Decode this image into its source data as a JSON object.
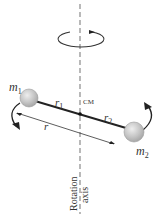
{
  "diagram": {
    "labels": {
      "mass1": "m",
      "mass1_sub": "1",
      "mass2": "m",
      "mass2_sub": "2",
      "radius1": "r",
      "radius1_sub": "1",
      "radius2": "r",
      "radius2_sub": "2",
      "separation": "r",
      "center_of_mass": "CM",
      "axis_line1": "Rotation",
      "axis_line2": "axis"
    },
    "colors": {
      "line": "#222222",
      "axis_dash": "#888888",
      "ball_fill": "#c8c8c8",
      "ball_stroke": "#9a9a9a",
      "text": "#333333"
    }
  }
}
